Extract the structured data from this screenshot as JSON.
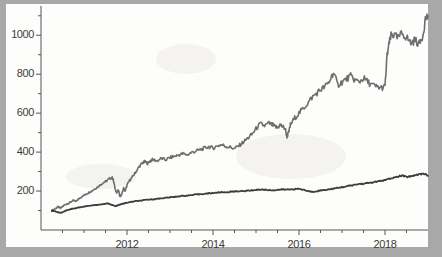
{
  "figure": {
    "background_color": "#a8a8a8",
    "paper_color": "#fdfdfc",
    "axis_color": "#555555"
  },
  "chart_data": {
    "type": "line",
    "title": "",
    "subtitle": "",
    "xlabel": "",
    "ylabel": "",
    "grid": false,
    "legend": null,
    "legend_position": "none",
    "xlim": [
      2010.0,
      2019.0
    ],
    "ylim": [
      0,
      1140
    ],
    "x_tick_labels": [
      "2012",
      "2014",
      "2016",
      "2018"
    ],
    "x_tick_values": [
      2012,
      2014,
      2016,
      2018
    ],
    "x_minor_ticks": [
      2010.5,
      2011,
      2011.5,
      2012.5,
      2013,
      2013.5,
      2014.5,
      2015,
      2015.5,
      2016.5,
      2017,
      2017.5,
      2018.5
    ],
    "y_tick_labels": [
      "200",
      "400",
      "600",
      "800",
      "1000"
    ],
    "y_tick_values": [
      200,
      400,
      600,
      800,
      1000
    ],
    "y_minor_ticks": [
      100,
      300,
      500,
      700,
      900,
      1100
    ],
    "series": [
      {
        "name": "upper-series",
        "color": "#6e6e6e",
        "line_width": 1.6,
        "x": [
          2010.25,
          2010.32,
          2010.39,
          2010.46,
          2010.53,
          2010.6,
          2010.67,
          2010.74,
          2010.81,
          2010.88,
          2010.95,
          2011.02,
          2011.09,
          2011.16,
          2011.23,
          2011.3,
          2011.37,
          2011.44,
          2011.51,
          2011.58,
          2011.65,
          2011.68,
          2011.72,
          2011.76,
          2011.8,
          2011.84,
          2011.88,
          2011.92,
          2011.96,
          2012.0,
          2012.06,
          2012.12,
          2012.18,
          2012.24,
          2012.3,
          2012.36,
          2012.42,
          2012.48,
          2012.54,
          2012.6,
          2012.7,
          2012.8,
          2012.9,
          2013.0,
          2013.1,
          2013.2,
          2013.3,
          2013.4,
          2013.5,
          2013.6,
          2013.7,
          2013.8,
          2013.9,
          2014.0,
          2014.1,
          2014.2,
          2014.3,
          2014.4,
          2014.5,
          2014.6,
          2014.7,
          2014.8,
          2014.9,
          2015.0,
          2015.1,
          2015.2,
          2015.3,
          2015.38,
          2015.44,
          2015.5,
          2015.56,
          2015.62,
          2015.68,
          2015.72,
          2015.76,
          2015.8,
          2015.9,
          2016.0,
          2016.1,
          2016.2,
          2016.3,
          2016.4,
          2016.5,
          2016.6,
          2016.7,
          2016.8,
          2016.9,
          2017.0,
          2017.1,
          2017.2,
          2017.3,
          2017.4,
          2017.5,
          2017.6,
          2017.7,
          2017.8,
          2017.9,
          2018.0,
          2018.05,
          2018.1,
          2018.15,
          2018.2,
          2018.3,
          2018.4,
          2018.5,
          2018.6,
          2018.7,
          2018.8,
          2018.88,
          2018.94,
          2019.0
        ],
        "y": [
          100,
          108,
          118,
          112,
          126,
          134,
          140,
          152,
          146,
          160,
          172,
          180,
          190,
          198,
          208,
          218,
          230,
          242,
          250,
          262,
          270,
          258,
          215,
          190,
          205,
          170,
          185,
          215,
          200,
          230,
          255,
          270,
          290,
          310,
          330,
          345,
          350,
          342,
          355,
          362,
          355,
          368,
          360,
          372,
          378,
          385,
          392,
          386,
          398,
          405,
          412,
          420,
          428,
          420,
          432,
          438,
          430,
          425,
          418,
          432,
          450,
          470,
          490,
          520,
          545,
          535,
          548,
          540,
          530,
          525,
          540,
          530,
          520,
          480,
          500,
          540,
          575,
          600,
          625,
          650,
          680,
          700,
          720,
          735,
          760,
          810,
          745,
          760,
          775,
          790,
          770,
          760,
          780,
          760,
          745,
          735,
          730,
          735,
          900,
          960,
          1005,
          1000,
          985,
          1010,
          990,
          960,
          975,
          955,
          1000,
          1085,
          1100
        ]
      },
      {
        "name": "lower-series",
        "color": "#3d3d3d",
        "line_width": 1.8,
        "x": [
          2010.25,
          2010.32,
          2010.39,
          2010.46,
          2010.53,
          2010.6,
          2010.67,
          2010.74,
          2010.81,
          2010.88,
          2010.95,
          2011.05,
          2011.15,
          2011.25,
          2011.35,
          2011.45,
          2011.55,
          2011.62,
          2011.68,
          2011.74,
          2011.8,
          2011.86,
          2011.92,
          2012.0,
          2012.1,
          2012.2,
          2012.3,
          2012.4,
          2012.5,
          2012.6,
          2012.7,
          2012.8,
          2012.9,
          2013.0,
          2013.1,
          2013.2,
          2013.3,
          2013.4,
          2013.5,
          2013.6,
          2013.7,
          2013.8,
          2013.9,
          2014.0,
          2014.1,
          2014.2,
          2014.3,
          2014.4,
          2014.5,
          2014.6,
          2014.7,
          2014.8,
          2014.9,
          2015.0,
          2015.1,
          2015.2,
          2015.3,
          2015.4,
          2015.5,
          2015.6,
          2015.7,
          2015.8,
          2015.9,
          2016.0,
          2016.1,
          2016.2,
          2016.3,
          2016.4,
          2016.5,
          2016.6,
          2016.7,
          2016.8,
          2016.9,
          2017.0,
          2017.1,
          2017.2,
          2017.3,
          2017.4,
          2017.5,
          2017.6,
          2017.7,
          2017.8,
          2017.9,
          2018.0,
          2018.1,
          2018.2,
          2018.3,
          2018.4,
          2018.5,
          2018.6,
          2018.7,
          2018.8,
          2018.9,
          2019.0
        ],
        "y": [
          100,
          96,
          92,
          88,
          95,
          102,
          106,
          110,
          112,
          116,
          118,
          122,
          125,
          128,
          130,
          133,
          136,
          132,
          126,
          122,
          128,
          132,
          136,
          140,
          144,
          148,
          150,
          153,
          156,
          158,
          160,
          163,
          165,
          168,
          170,
          173,
          175,
          177,
          179,
          182,
          184,
          186,
          188,
          190,
          192,
          194,
          193,
          196,
          198,
          200,
          199,
          202,
          204,
          206,
          208,
          207,
          205,
          204,
          206,
          208,
          207,
          209,
          210,
          211,
          207,
          200,
          196,
          199,
          203,
          206,
          209,
          212,
          216,
          220,
          224,
          228,
          232,
          236,
          238,
          241,
          244,
          248,
          252,
          256,
          262,
          268,
          274,
          280,
          272,
          276,
          282,
          286,
          290,
          278
        ]
      }
    ],
    "annotations": []
  }
}
